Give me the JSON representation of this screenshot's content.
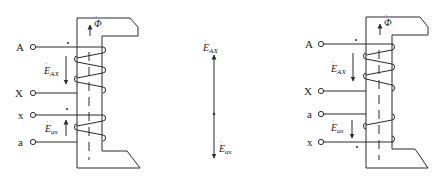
{
  "left_diagram": {
    "terminals": [
      {
        "label": "A",
        "y": 47
      },
      {
        "label": "X",
        "y": 93
      },
      {
        "label": "x",
        "y": 115
      },
      {
        "label": "a",
        "y": 142
      }
    ],
    "flux_symbol": "Φ",
    "emf_primary": {
      "symbol": "E",
      "sub": "AX",
      "direction": "down"
    },
    "emf_secondary": {
      "symbol": "E",
      "sub": "ax",
      "direction": "up"
    }
  },
  "phasor_diagram": {
    "upper": {
      "symbol": "E",
      "sub": "AX",
      "direction": "up"
    },
    "lower": {
      "symbol": "E",
      "sub": "ax",
      "direction": "down"
    }
  },
  "right_diagram": {
    "terminals": [
      {
        "label": "A",
        "y": 44
      },
      {
        "label": "X",
        "y": 91
      },
      {
        "label": "a",
        "y": 114
      },
      {
        "label": "x",
        "y": 142
      }
    ],
    "flux_symbol": "Φ",
    "emf_primary": {
      "symbol": "E",
      "sub": "AX",
      "direction": "down"
    },
    "emf_secondary": {
      "symbol": "E",
      "sub": "ax",
      "direction": "down"
    }
  },
  "colors": {
    "stroke": "#2b2b2b",
    "background": "#ffffff"
  }
}
